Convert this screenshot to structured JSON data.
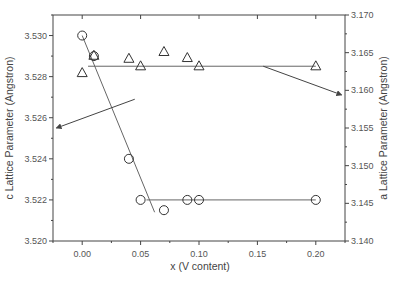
{
  "chart_data": {
    "type": "scatter",
    "title": "",
    "xlabel": "x (V content)",
    "ylabel": "c Lattice Parameter (Angstron)",
    "ylabel_right": "a Lattice Parameter (Angstron)",
    "xlim": [
      -0.025,
      0.225
    ],
    "ylim": [
      3.52,
      3.531
    ],
    "ylim_right": [
      3.14,
      3.17
    ],
    "x_ticks": [
      "0.00",
      "0.05",
      "0.10",
      "0.15",
      "0.20"
    ],
    "x_tick_values": [
      0.0,
      0.05,
      0.1,
      0.15,
      0.2
    ],
    "y_ticks": [
      "3.520",
      "3.522",
      "3.524",
      "3.526",
      "3.528",
      "3.530"
    ],
    "y_tick_values": [
      3.52,
      3.522,
      3.524,
      3.526,
      3.528,
      3.53
    ],
    "y_ticks_right": [
      "3.140",
      "3.145",
      "3.150",
      "3.155",
      "3.160",
      "3.165",
      "3.170"
    ],
    "y_tick_values_right": [
      3.14,
      3.145,
      3.15,
      3.155,
      3.16,
      3.165,
      3.17
    ],
    "grid": false,
    "legend": "none",
    "series": [
      {
        "name": "c lattice parameter",
        "axis": "left",
        "marker": "circle",
        "x": [
          0.0,
          0.01,
          0.04,
          0.05,
          0.07,
          0.09,
          0.1,
          0.2
        ],
        "values": [
          3.53,
          3.529,
          3.524,
          3.522,
          3.5215,
          3.522,
          3.522,
          3.522
        ]
      },
      {
        "name": "a lattice parameter",
        "axis": "right",
        "marker": "triangle",
        "x": [
          0.0,
          0.01,
          0.04,
          0.05,
          0.07,
          0.09,
          0.1,
          0.2
        ],
        "values": [
          3.1623,
          3.1646,
          3.1642,
          3.1632,
          3.1651,
          3.1643,
          3.1632,
          3.1632
        ]
      }
    ],
    "fit_lines": [
      {
        "name": "c decreasing trend",
        "axis": "left",
        "x": [
          0.0,
          0.062
        ],
        "values": [
          3.53,
          3.5214
        ]
      },
      {
        "name": "c plateau",
        "axis": "left",
        "x": [
          0.055,
          0.2
        ],
        "values": [
          3.522,
          3.522
        ]
      },
      {
        "name": "a constant",
        "axis": "right",
        "x": [
          0.005,
          0.2
        ],
        "values": [
          3.1632,
          3.1632
        ]
      }
    ],
    "annotations": [
      {
        "type": "arrow",
        "description": "points from c trend line to left axis",
        "from_x": 0.045,
        "from_y_left": 3.5269,
        "to_x": -0.022,
        "to_y_left": 3.5255
      },
      {
        "type": "arrow",
        "description": "points from a constant line to right axis",
        "from_x": 0.155,
        "from_y_right": 3.1632,
        "to_x": 0.222,
        "to_y_right": 3.1594
      }
    ]
  }
}
